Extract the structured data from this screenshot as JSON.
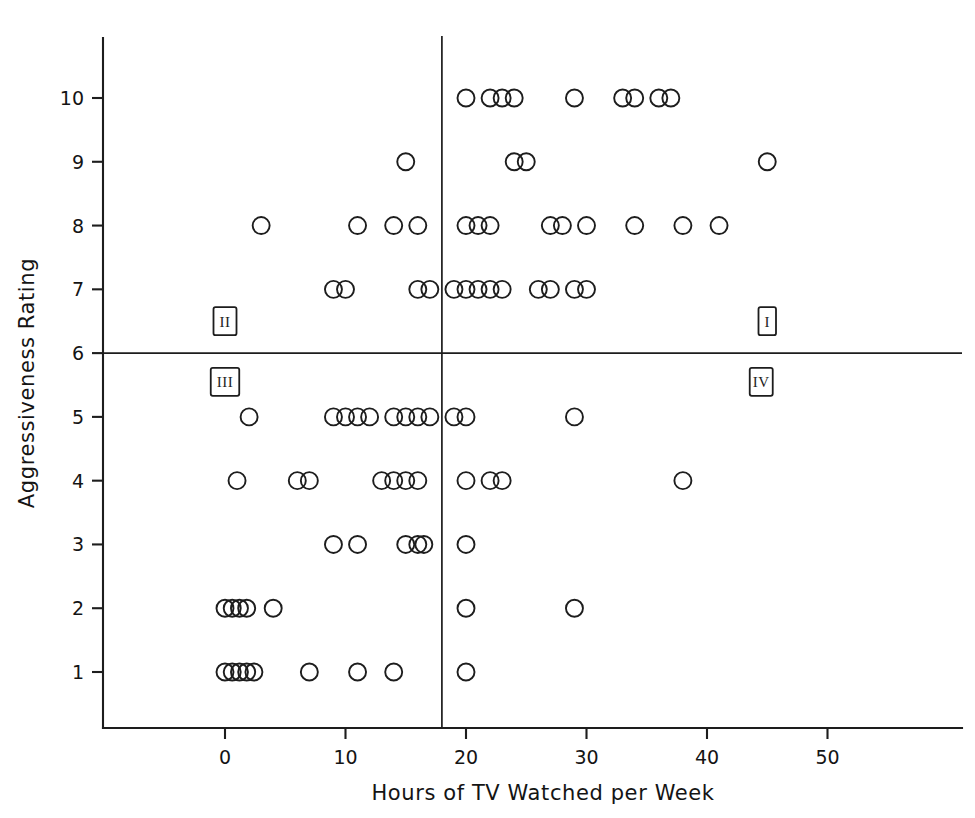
{
  "chart_data": {
    "type": "scatter",
    "title": "",
    "xlabel": "Hours of TV Watched per Week",
    "ylabel": "Aggressiveness Rating",
    "xlim": [
      -3,
      57
    ],
    "ylim": [
      0.2,
      11.4
    ],
    "xticks": [
      0,
      10,
      20,
      30,
      40,
      50
    ],
    "yticks": [
      1,
      2,
      3,
      4,
      5,
      6,
      7,
      8,
      9,
      10
    ],
    "grid": false,
    "legend": "none",
    "reference_lines": [
      {
        "name": "horizontal-median-line",
        "axis": "y",
        "value": 6
      },
      {
        "name": "vertical-median-line",
        "axis": "x",
        "value": 18
      }
    ],
    "quadrant_labels": [
      {
        "label": "I",
        "x": 45,
        "y": 6.5
      },
      {
        "label": "II",
        "x": 0,
        "y": 6.5
      },
      {
        "label": "III",
        "x": 0,
        "y": 5.55
      },
      {
        "label": "IV",
        "x": 44.5,
        "y": 5.55
      }
    ],
    "marker": "open-circle",
    "points": [
      {
        "x": 20,
        "y": 10
      },
      {
        "x": 22,
        "y": 10
      },
      {
        "x": 23,
        "y": 10
      },
      {
        "x": 24,
        "y": 10
      },
      {
        "x": 29,
        "y": 10
      },
      {
        "x": 33,
        "y": 10
      },
      {
        "x": 34,
        "y": 10
      },
      {
        "x": 36,
        "y": 10
      },
      {
        "x": 37,
        "y": 10
      },
      {
        "x": 15,
        "y": 9
      },
      {
        "x": 24,
        "y": 9
      },
      {
        "x": 25,
        "y": 9
      },
      {
        "x": 45,
        "y": 9
      },
      {
        "x": 3,
        "y": 8
      },
      {
        "x": 11,
        "y": 8
      },
      {
        "x": 14,
        "y": 8
      },
      {
        "x": 16,
        "y": 8
      },
      {
        "x": 20,
        "y": 8
      },
      {
        "x": 21,
        "y": 8
      },
      {
        "x": 22,
        "y": 8
      },
      {
        "x": 27,
        "y": 8
      },
      {
        "x": 28,
        "y": 8
      },
      {
        "x": 30,
        "y": 8
      },
      {
        "x": 34,
        "y": 8
      },
      {
        "x": 38,
        "y": 8
      },
      {
        "x": 41,
        "y": 8
      },
      {
        "x": 9,
        "y": 7
      },
      {
        "x": 10,
        "y": 7
      },
      {
        "x": 16,
        "y": 7
      },
      {
        "x": 17,
        "y": 7
      },
      {
        "x": 19,
        "y": 7
      },
      {
        "x": 20,
        "y": 7
      },
      {
        "x": 21,
        "y": 7
      },
      {
        "x": 22,
        "y": 7
      },
      {
        "x": 23,
        "y": 7
      },
      {
        "x": 26,
        "y": 7
      },
      {
        "x": 27,
        "y": 7
      },
      {
        "x": 29,
        "y": 7
      },
      {
        "x": 30,
        "y": 7
      },
      {
        "x": 2,
        "y": 5
      },
      {
        "x": 9,
        "y": 5
      },
      {
        "x": 10,
        "y": 5
      },
      {
        "x": 11,
        "y": 5
      },
      {
        "x": 12,
        "y": 5
      },
      {
        "x": 14,
        "y": 5
      },
      {
        "x": 15,
        "y": 5
      },
      {
        "x": 16,
        "y": 5
      },
      {
        "x": 17,
        "y": 5
      },
      {
        "x": 19,
        "y": 5
      },
      {
        "x": 20,
        "y": 5
      },
      {
        "x": 29,
        "y": 5
      },
      {
        "x": 1,
        "y": 4
      },
      {
        "x": 6,
        "y": 4
      },
      {
        "x": 7,
        "y": 4
      },
      {
        "x": 13,
        "y": 4
      },
      {
        "x": 14,
        "y": 4
      },
      {
        "x": 15,
        "y": 4
      },
      {
        "x": 16,
        "y": 4
      },
      {
        "x": 20,
        "y": 4
      },
      {
        "x": 22,
        "y": 4
      },
      {
        "x": 23,
        "y": 4
      },
      {
        "x": 38,
        "y": 4
      },
      {
        "x": 9,
        "y": 3
      },
      {
        "x": 11,
        "y": 3
      },
      {
        "x": 15,
        "y": 3
      },
      {
        "x": 16,
        "y": 3
      },
      {
        "x": 16.5,
        "y": 3
      },
      {
        "x": 20,
        "y": 3
      },
      {
        "x": 0,
        "y": 2
      },
      {
        "x": 0.6,
        "y": 2
      },
      {
        "x": 1.2,
        "y": 2
      },
      {
        "x": 1.8,
        "y": 2
      },
      {
        "x": 4,
        "y": 2
      },
      {
        "x": 20,
        "y": 2
      },
      {
        "x": 29,
        "y": 2
      },
      {
        "x": 0,
        "y": 1
      },
      {
        "x": 0.6,
        "y": 1
      },
      {
        "x": 1.2,
        "y": 1
      },
      {
        "x": 1.8,
        "y": 1
      },
      {
        "x": 2.4,
        "y": 1
      },
      {
        "x": 7,
        "y": 1
      },
      {
        "x": 11,
        "y": 1
      },
      {
        "x": 14,
        "y": 1
      },
      {
        "x": 20,
        "y": 1
      }
    ]
  },
  "style": {
    "ink_color": "#1d1d1d",
    "background_color": "#ffffff",
    "marker_radius_px": 8.5
  }
}
